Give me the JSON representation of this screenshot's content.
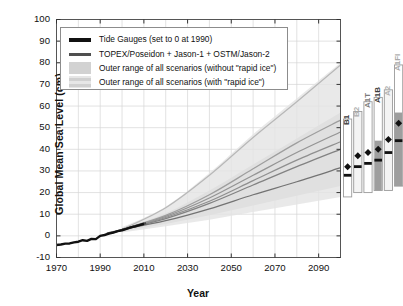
{
  "chart_data": {
    "type": "line",
    "title": "",
    "xlabel": "Year",
    "ylabel": "Global Mean Sea Level (cm)",
    "xlim": [
      1970,
      2100
    ],
    "ylim": [
      -10,
      100
    ],
    "xticks": [
      1970,
      1990,
      2010,
      2030,
      2050,
      2070,
      2090
    ],
    "yticks": [
      -10,
      0,
      10,
      20,
      30,
      40,
      50,
      60,
      70,
      80,
      90,
      100
    ],
    "xminor_step": 10,
    "yminor_step": 10,
    "grid": true,
    "legend_position": "upper left",
    "legend": [
      {
        "label": "Tide Gauges (set to 0 at 1990)",
        "style": "line",
        "color": "#111111"
      },
      {
        "label": "TOPEX/Poseidon + Jason-1 + OSTM/Jason-2",
        "style": "line",
        "color": "#4a4a4a"
      },
      {
        "label": "Outer range of all scenarios (without \"rapid ice\")",
        "style": "block",
        "color": "#cfcfcf"
      },
      {
        "label": "Outer range of all scenarios (with \"rapid ice\")",
        "style": "block",
        "color": "#e2e2e2"
      }
    ],
    "series": [
      {
        "name": "Tide Gauges (set to 0 at 1990)",
        "color": "#111111",
        "x": [
          1970,
          1972,
          1974,
          1976,
          1978,
          1980,
          1982,
          1984,
          1986,
          1988,
          1990,
          1992,
          1994,
          1996,
          1998,
          2000,
          2002,
          2004,
          2006,
          2008,
          2010
        ],
        "y": [
          -4.2,
          -4.0,
          -3.6,
          -3.5,
          -3.0,
          -2.7,
          -2.0,
          -2.3,
          -1.4,
          -1.5,
          0.0,
          0.4,
          1.0,
          1.5,
          2.2,
          2.6,
          3.2,
          3.9,
          4.4,
          5.0,
          5.6
        ]
      },
      {
        "name": "TOPEX/Poseidon + Jason-1 + OSTM/Jason-2",
        "color": "#4a4a4a",
        "x": [
          1993,
          1996,
          1999,
          2002,
          2005,
          2008,
          2011
        ],
        "y": [
          1.0,
          1.7,
          2.5,
          3.3,
          4.2,
          5.0,
          5.9
        ]
      },
      {
        "name": "Scenario central projection (lowest)",
        "color": "#6d6d6d",
        "x": [
          2000,
          2020,
          2040,
          2060,
          2080,
          2100
        ],
        "y": [
          3.0,
          7.0,
          12.5,
          19.0,
          25.0,
          31.5
        ]
      },
      {
        "name": "Scenario central projection (mid-low)",
        "color": "#7c7c7c",
        "x": [
          2000,
          2020,
          2040,
          2060,
          2080,
          2100
        ],
        "y": [
          3.0,
          8.0,
          15.0,
          23.5,
          32.0,
          40.0
        ]
      },
      {
        "name": "Scenario central projection (mid)",
        "color": "#8a8a8a",
        "x": [
          2000,
          2020,
          2040,
          2060,
          2080,
          2100
        ],
        "y": [
          3.0,
          8.5,
          16.0,
          25.5,
          35.0,
          43.5
        ]
      },
      {
        "name": "Scenario central projection (mid-high)",
        "color": "#8f8f8f",
        "x": [
          2000,
          2020,
          2040,
          2060,
          2080,
          2100
        ],
        "y": [
          3.0,
          9.0,
          17.5,
          28.0,
          38.5,
          48.0
        ]
      },
      {
        "name": "Scenario central projection (high)",
        "color": "#9a9a9a",
        "x": [
          2000,
          2020,
          2040,
          2060,
          2080,
          2100
        ],
        "y": [
          3.0,
          9.5,
          19.0,
          31.0,
          43.0,
          53.5
        ]
      },
      {
        "name": "Rapid ice upper envelope",
        "color": "#b5b5b5",
        "x": [
          2000,
          2020,
          2040,
          2060,
          2080,
          2100
        ],
        "y": [
          3.0,
          13.0,
          28.0,
          45.5,
          62.0,
          79.0
        ]
      }
    ],
    "bands": [
      {
        "name": "Outer range of all scenarios (without \"rapid ice\")",
        "color": "#cfcfcf",
        "x": [
          2000,
          2020,
          2040,
          2060,
          2080,
          2100
        ],
        "lower": [
          2.0,
          5.5,
          9.5,
          14.0,
          18.5,
          23.0
        ],
        "upper": [
          3.5,
          10.5,
          21.0,
          33.0,
          45.0,
          57.0
        ]
      },
      {
        "name": "Outer range of all scenarios (with \"rapid ice\")",
        "color": "#e3e3e3",
        "x": [
          2000,
          2020,
          2040,
          2060,
          2080,
          2100
        ],
        "lower": [
          1.5,
          4.5,
          7.5,
          11.0,
          14.5,
          18.0
        ],
        "upper": [
          4.0,
          13.5,
          29.0,
          47.0,
          63.5,
          80.0
        ]
      }
    ],
    "scenario_bars": {
      "note": "SRES scenario ranges at 2100; diamond = rapid-ice median, dash = no-rapid-ice median",
      "bars": [
        {
          "label": "B1",
          "low": 18.0,
          "high": 54.0,
          "mid_fill_low": 18.0,
          "mid_fill_high": 18.0,
          "dash": 28.0,
          "diamond": 32.0,
          "fill": "#ffffff",
          "label_color": "#3a3a3a"
        },
        {
          "label": "B2",
          "low": 20.0,
          "high": 57.5,
          "mid_fill_low": 20.0,
          "mid_fill_high": 20.0,
          "dash": 32.0,
          "diamond": 37.0,
          "fill": "#f4f4f4",
          "label_color": "#b0b0b0"
        },
        {
          "label": "A1T",
          "low": 20.0,
          "high": 62.0,
          "mid_fill_low": 20.0,
          "mid_fill_high": 20.0,
          "dash": 33.5,
          "diamond": 38.5,
          "fill": "#ffffff",
          "label_color": "#7a7a7a"
        },
        {
          "label": "A1B",
          "low": 21.0,
          "high": 64.0,
          "mid_fill_low": 21.0,
          "mid_fill_high": 44.0,
          "dash": 35.0,
          "diamond": 40.0,
          "fill": "#ffffff",
          "label_color": "#3a3a3a"
        },
        {
          "label": "A2",
          "low": 21.0,
          "high": 67.5,
          "mid_fill_low": 21.0,
          "mid_fill_high": 21.0,
          "dash": 38.5,
          "diamond": 44.5,
          "fill": "#f4f4f4",
          "label_color": "#b0b0b0"
        },
        {
          "label": "A1FI",
          "low": 23.0,
          "high": 79.0,
          "mid_fill_low": 23.0,
          "mid_fill_high": 57.0,
          "dash": 44.0,
          "diamond": 52.0,
          "fill": "#ffffff",
          "label_color": "#a8a8a8"
        }
      ]
    }
  }
}
